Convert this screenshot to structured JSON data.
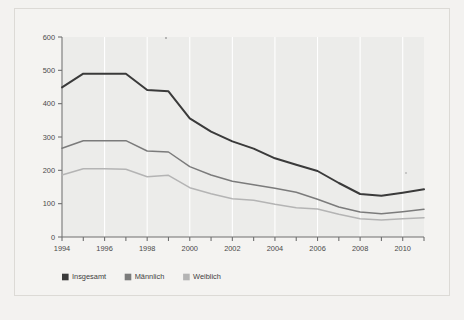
{
  "figure": {
    "background_color": "#f3f2f0",
    "plot_background_color": "#ececea",
    "frame_color": "#dcdad6"
  },
  "chart_data": {
    "type": "line",
    "title": "",
    "subtitle": "",
    "xlabel": "",
    "ylabel": "",
    "x": [
      1994,
      1995,
      1996,
      1997,
      1998,
      1999,
      2000,
      2001,
      2002,
      2003,
      2004,
      2005,
      2006,
      2007,
      2008,
      2009,
      2010,
      2011
    ],
    "categories": [
      "1994",
      "1995",
      "1996",
      "1997",
      "1998",
      "1999",
      "2000",
      "2001",
      "2002",
      "2003",
      "2004",
      "2005",
      "2006",
      "2007",
      "2008",
      "2009",
      "2010",
      "2011"
    ],
    "x_tick_labels": [
      "1994",
      "",
      "1996",
      "",
      "1998",
      "",
      "2000",
      "",
      "2002",
      "",
      "2004",
      "",
      "2006",
      "",
      "2008",
      "",
      "2010",
      ""
    ],
    "y_tick_labels": [
      "0",
      "100",
      "200",
      "300",
      "400",
      "500",
      "600"
    ],
    "y_ticks": [
      0,
      100,
      200,
      300,
      400,
      500,
      600
    ],
    "xlim": [
      1994,
      2011
    ],
    "ylim": [
      0,
      600
    ],
    "grid": "vertical-white",
    "legend_position": "bottom-left",
    "series": [
      {
        "name": "Insgesamt",
        "color": "#3a3a3a",
        "width": 2.0,
        "values": [
          449,
          490,
          490,
          490,
          441,
          437,
          356,
          316,
          287,
          265,
          236,
          217,
          198,
          162,
          129,
          124,
          133,
          143
        ]
      },
      {
        "name": "Männlich",
        "color": "#7b7b7b",
        "width": 1.5,
        "values": [
          266,
          289,
          289,
          289,
          258,
          255,
          211,
          186,
          167,
          157,
          146,
          134,
          113,
          90,
          75,
          70,
          76,
          83
        ]
      },
      {
        "name": "Weiblich",
        "color": "#b4b4b4",
        "width": 1.5,
        "values": [
          186,
          205,
          205,
          203,
          181,
          185,
          148,
          130,
          115,
          110,
          98,
          88,
          84,
          68,
          55,
          51,
          55,
          58
        ]
      }
    ]
  },
  "legend": {
    "items": [
      {
        "label": "Insgesamt",
        "color": "#3a3a3a"
      },
      {
        "label": "Männlich",
        "color": "#7b7b7b"
      },
      {
        "label": "Weiblich",
        "color": "#b4b4b4"
      }
    ]
  }
}
